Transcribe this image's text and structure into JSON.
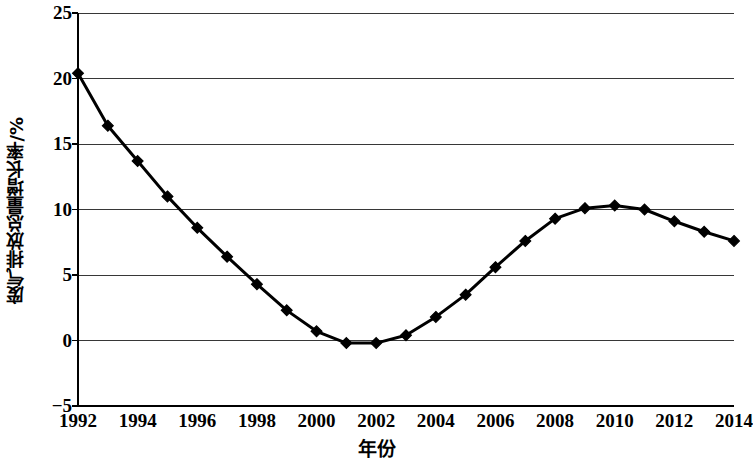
{
  "chart_data": {
    "type": "line",
    "title": "",
    "xlabel": "年份",
    "ylabel": "废气排放总量增长率/%",
    "xlim": [
      1992,
      2014
    ],
    "ylim": [
      -5,
      25
    ],
    "grid": "horizontal",
    "legend": "none",
    "marker": "diamond",
    "series_color": "#000000",
    "x": [
      1992,
      1993,
      1994,
      1995,
      1996,
      1997,
      1998,
      1999,
      2000,
      2001,
      2002,
      2003,
      2004,
      2005,
      2006,
      2007,
      2008,
      2009,
      2010,
      2011,
      2012,
      2013,
      2014
    ],
    "values": [
      20.4,
      16.4,
      13.7,
      11.0,
      8.6,
      6.4,
      4.3,
      2.3,
      0.7,
      -0.2,
      -0.2,
      0.4,
      1.8,
      3.5,
      5.6,
      7.6,
      9.3,
      10.1,
      10.3,
      10.0,
      9.1,
      8.3,
      7.6
    ],
    "series": [
      {
        "name": "废气排放总量增长率",
        "values": [
          20.4,
          16.4,
          13.7,
          11.0,
          8.6,
          6.4,
          4.3,
          2.3,
          0.7,
          -0.2,
          -0.2,
          0.4,
          1.8,
          3.5,
          5.6,
          7.6,
          9.3,
          10.1,
          10.3,
          10.0,
          9.1,
          8.3,
          7.6
        ]
      }
    ],
    "yticks": [
      25,
      20,
      15,
      10,
      5,
      0,
      -5
    ],
    "ytick_labels": [
      "25",
      "20",
      "15",
      "10",
      "5",
      "0",
      "−5"
    ],
    "xticks": [
      1992,
      1994,
      1996,
      1998,
      2000,
      2002,
      2004,
      2006,
      2008,
      2010,
      2012,
      2014
    ],
    "xtick_labels": [
      "1992",
      "1994",
      "1996",
      "1998",
      "2000",
      "2002",
      "2004",
      "2006",
      "2008",
      "2010",
      "2012",
      "2014"
    ]
  }
}
